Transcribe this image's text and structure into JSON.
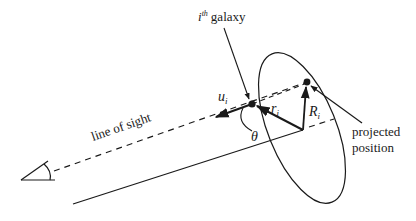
{
  "diagram": {
    "labels": {
      "galaxy_i": "i",
      "galaxy_th": "th",
      "galaxy_word": "galaxy",
      "u": "u",
      "u_sub": "i",
      "r": "r",
      "r_sub": "i",
      "R": "R",
      "R_sub": "i",
      "theta": "θ",
      "line_of_sight": "line of sight",
      "projected_line1": "projected",
      "projected_line2": "position"
    },
    "colors": {
      "ink": "#1a1a1a",
      "background": "#ffffff"
    },
    "elements": [
      "observer-eye",
      "line-of-sight-dashed",
      "sky-plane-ellipse",
      "galaxy-point",
      "projected-position-point",
      "velocity-vector-u",
      "radius-vector-r",
      "projected-radius-R",
      "angle-theta",
      "cluster-center-axis"
    ]
  }
}
